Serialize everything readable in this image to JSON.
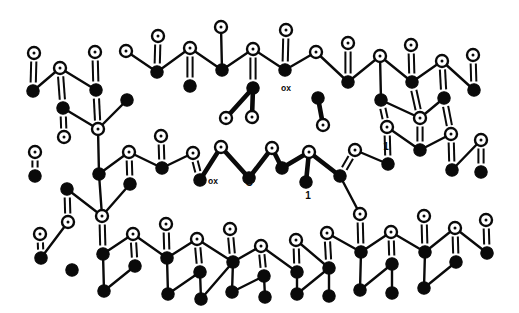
{
  "figure": {
    "background_color": "#ffffff",
    "ink_color": "#0a0a0a",
    "width": 519,
    "height": 313
  },
  "legend": {
    "atom_types": [
      {
        "key": "dark",
        "name": "filled-atom",
        "fill": "#0a0a0a",
        "description": "solid black circle"
      },
      {
        "key": "open",
        "name": "open-atom",
        "fill": "#ffffff",
        "description": "open circle with central dot"
      }
    ],
    "bond_types": [
      {
        "key": "single",
        "name": "single-bond",
        "description": "thin line"
      },
      {
        "key": "double",
        "name": "double-bond",
        "description": "parallel pair of lines"
      },
      {
        "key": "bold",
        "name": "bold-bond",
        "description": "thick line marking defect core"
      }
    ]
  },
  "annotations": [
    {
      "id": "ox-top",
      "text": "ox",
      "x": 286,
      "y": 91,
      "name": "label-ox-top"
    },
    {
      "id": "ox-left",
      "text": "ox",
      "x": 213,
      "y": 184,
      "name": "label-ox-left"
    },
    {
      "id": "c-center",
      "text": "C",
      "x": 249,
      "y": 186,
      "name": "label-c-center"
    },
    {
      "id": "one-right",
      "text": "1",
      "x": 386,
      "y": 150,
      "name": "label-one-right"
    },
    {
      "id": "one-lower",
      "text": "1",
      "x": 308,
      "y": 199,
      "name": "label-one-lower"
    }
  ],
  "chart_data": {
    "type": "scatter",
    "xlabel": "",
    "ylabel": "",
    "grid": false,
    "legend": "none",
    "xlim": [
      0,
      519
    ],
    "ylim": [
      0,
      313
    ],
    "atoms": [
      {
        "i": 0,
        "t": "open",
        "x": 60,
        "y": 68
      },
      {
        "i": 1,
        "t": "open",
        "x": 34,
        "y": 53
      },
      {
        "i": 2,
        "t": "dark",
        "x": 33,
        "y": 91
      },
      {
        "i": 3,
        "t": "dark",
        "x": 63,
        "y": 108
      },
      {
        "i": 4,
        "t": "open",
        "x": 95,
        "y": 52
      },
      {
        "i": 5,
        "t": "open",
        "x": 126,
        "y": 51
      },
      {
        "i": 6,
        "t": "dark",
        "x": 96,
        "y": 90
      },
      {
        "i": 7,
        "t": "dark",
        "x": 127,
        "y": 100
      },
      {
        "i": 8,
        "t": "open",
        "x": 158,
        "y": 36
      },
      {
        "i": 9,
        "t": "open",
        "x": 190,
        "y": 48
      },
      {
        "i": 10,
        "t": "dark",
        "x": 157,
        "y": 72
      },
      {
        "i": 11,
        "t": "dark",
        "x": 190,
        "y": 86
      },
      {
        "i": 12,
        "t": "open",
        "x": 221,
        "y": 27
      },
      {
        "i": 13,
        "t": "open",
        "x": 253,
        "y": 49
      },
      {
        "i": 14,
        "t": "dark",
        "x": 222,
        "y": 70
      },
      {
        "i": 15,
        "t": "dark",
        "x": 253,
        "y": 88
      },
      {
        "i": 16,
        "t": "open",
        "x": 286,
        "y": 30
      },
      {
        "i": 17,
        "t": "open",
        "x": 316,
        "y": 52
      },
      {
        "i": 18,
        "t": "dark",
        "x": 285,
        "y": 70
      },
      {
        "i": 19,
        "t": "dark",
        "x": 318,
        "y": 98
      },
      {
        "i": 20,
        "t": "open",
        "x": 348,
        "y": 43
      },
      {
        "i": 21,
        "t": "open",
        "x": 380,
        "y": 56
      },
      {
        "i": 22,
        "t": "dark",
        "x": 348,
        "y": 82
      },
      {
        "i": 23,
        "t": "dark",
        "x": 381,
        "y": 100
      },
      {
        "i": 24,
        "t": "open",
        "x": 411,
        "y": 45
      },
      {
        "i": 25,
        "t": "open",
        "x": 442,
        "y": 61
      },
      {
        "i": 26,
        "t": "dark",
        "x": 412,
        "y": 82
      },
      {
        "i": 27,
        "t": "dark",
        "x": 444,
        "y": 98
      },
      {
        "i": 28,
        "t": "open",
        "x": 473,
        "y": 55
      },
      {
        "i": 29,
        "t": "dark",
        "x": 474,
        "y": 90
      },
      {
        "i": 30,
        "t": "open",
        "x": 64,
        "y": 137
      },
      {
        "i": 31,
        "t": "open",
        "x": 35,
        "y": 152
      },
      {
        "i": 32,
        "t": "dark",
        "x": 35,
        "y": 176
      },
      {
        "i": 33,
        "t": "dark",
        "x": 67,
        "y": 189
      },
      {
        "i": 34,
        "t": "open",
        "x": 98,
        "y": 129
      },
      {
        "i": 35,
        "t": "open",
        "x": 129,
        "y": 152
      },
      {
        "i": 36,
        "t": "dark",
        "x": 99,
        "y": 174
      },
      {
        "i": 37,
        "t": "dark",
        "x": 130,
        "y": 184
      },
      {
        "i": 38,
        "t": "open",
        "x": 161,
        "y": 136
      },
      {
        "i": 39,
        "t": "open",
        "x": 193,
        "y": 153
      },
      {
        "i": 40,
        "t": "dark",
        "x": 162,
        "y": 168
      },
      {
        "i": 41,
        "t": "dark",
        "x": 200,
        "y": 180
      },
      {
        "i": 42,
        "t": "open",
        "x": 226,
        "y": 118
      },
      {
        "i": 43,
        "t": "open",
        "x": 221,
        "y": 147
      },
      {
        "i": 44,
        "t": "open",
        "x": 252,
        "y": 117
      },
      {
        "i": 45,
        "t": "open",
        "x": 272,
        "y": 148
      },
      {
        "i": 46,
        "t": "dark",
        "x": 249,
        "y": 178
      },
      {
        "i": 47,
        "t": "dark",
        "x": 282,
        "y": 168
      },
      {
        "i": 48,
        "t": "open",
        "x": 309,
        "y": 152
      },
      {
        "i": 49,
        "t": "open",
        "x": 323,
        "y": 125
      },
      {
        "i": 50,
        "t": "dark",
        "x": 306,
        "y": 182
      },
      {
        "i": 51,
        "t": "dark",
        "x": 340,
        "y": 176
      },
      {
        "i": 52,
        "t": "open",
        "x": 355,
        "y": 150
      },
      {
        "i": 53,
        "t": "open",
        "x": 387,
        "y": 127
      },
      {
        "i": 54,
        "t": "dark",
        "x": 388,
        "y": 164
      },
      {
        "i": 55,
        "t": "dark",
        "x": 420,
        "y": 150
      },
      {
        "i": 56,
        "t": "open",
        "x": 420,
        "y": 118
      },
      {
        "i": 57,
        "t": "open",
        "x": 451,
        "y": 134
      },
      {
        "i": 58,
        "t": "dark",
        "x": 452,
        "y": 170
      },
      {
        "i": 59,
        "t": "open",
        "x": 481,
        "y": 140
      },
      {
        "i": 60,
        "t": "dark",
        "x": 481,
        "y": 172
      },
      {
        "i": 61,
        "t": "open",
        "x": 68,
        "y": 222
      },
      {
        "i": 62,
        "t": "open",
        "x": 40,
        "y": 234
      },
      {
        "i": 63,
        "t": "dark",
        "x": 41,
        "y": 258
      },
      {
        "i": 64,
        "t": "dark",
        "x": 72,
        "y": 270
      },
      {
        "i": 65,
        "t": "open",
        "x": 102,
        "y": 216
      },
      {
        "i": 66,
        "t": "open",
        "x": 133,
        "y": 234
      },
      {
        "i": 67,
        "t": "dark",
        "x": 103,
        "y": 254
      },
      {
        "i": 68,
        "t": "dark",
        "x": 135,
        "y": 266
      },
      {
        "i": 69,
        "t": "open",
        "x": 166,
        "y": 224
      },
      {
        "i": 70,
        "t": "open",
        "x": 197,
        "y": 239
      },
      {
        "i": 71,
        "t": "dark",
        "x": 167,
        "y": 258
      },
      {
        "i": 72,
        "t": "dark",
        "x": 200,
        "y": 272
      },
      {
        "i": 73,
        "t": "open",
        "x": 230,
        "y": 229
      },
      {
        "i": 74,
        "t": "open",
        "x": 261,
        "y": 246
      },
      {
        "i": 75,
        "t": "dark",
        "x": 233,
        "y": 262
      },
      {
        "i": 76,
        "t": "dark",
        "x": 264,
        "y": 276
      },
      {
        "i": 77,
        "t": "open",
        "x": 296,
        "y": 240
      },
      {
        "i": 78,
        "t": "open",
        "x": 327,
        "y": 233
      },
      {
        "i": 79,
        "t": "dark",
        "x": 297,
        "y": 272
      },
      {
        "i": 80,
        "t": "dark",
        "x": 329,
        "y": 268
      },
      {
        "i": 81,
        "t": "open",
        "x": 360,
        "y": 214
      },
      {
        "i": 82,
        "t": "open",
        "x": 391,
        "y": 232
      },
      {
        "i": 83,
        "t": "dark",
        "x": 361,
        "y": 252
      },
      {
        "i": 84,
        "t": "dark",
        "x": 392,
        "y": 264
      },
      {
        "i": 85,
        "t": "open",
        "x": 424,
        "y": 216
      },
      {
        "i": 86,
        "t": "open",
        "x": 455,
        "y": 228
      },
      {
        "i": 87,
        "t": "dark",
        "x": 425,
        "y": 252
      },
      {
        "i": 88,
        "t": "dark",
        "x": 456,
        "y": 262
      },
      {
        "i": 89,
        "t": "open",
        "x": 486,
        "y": 220
      },
      {
        "i": 90,
        "t": "dark",
        "x": 487,
        "y": 253
      },
      {
        "i": 91,
        "t": "dark",
        "x": 104,
        "y": 291
      },
      {
        "i": 92,
        "t": "dark",
        "x": 168,
        "y": 294
      },
      {
        "i": 93,
        "t": "dark",
        "x": 232,
        "y": 292
      },
      {
        "i": 94,
        "t": "dark",
        "x": 265,
        "y": 297
      },
      {
        "i": 95,
        "t": "dark",
        "x": 297,
        "y": 294
      },
      {
        "i": 96,
        "t": "dark",
        "x": 360,
        "y": 290
      },
      {
        "i": 97,
        "t": "dark",
        "x": 424,
        "y": 288
      },
      {
        "i": 98,
        "t": "dark",
        "x": 201,
        "y": 299
      },
      {
        "i": 99,
        "t": "dark",
        "x": 329,
        "y": 296
      },
      {
        "i": 100,
        "t": "dark",
        "x": 392,
        "y": 293
      }
    ]
  }
}
